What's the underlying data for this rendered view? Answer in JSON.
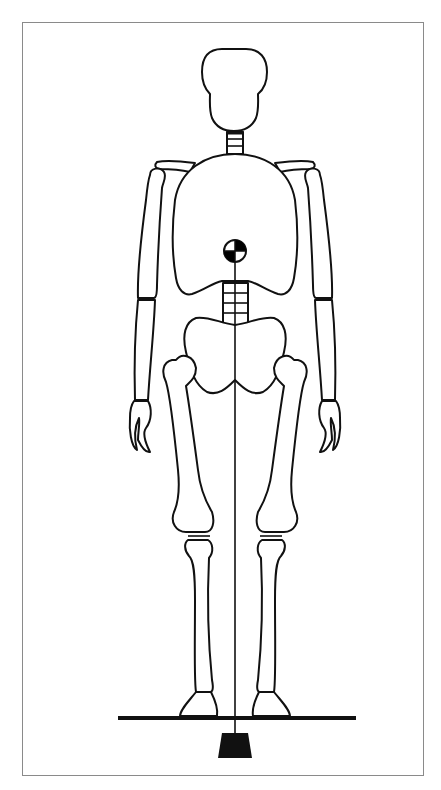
{
  "diagram": {
    "title": "",
    "elements": [
      {
        "id": "skull",
        "label": ""
      },
      {
        "id": "cervical-spine",
        "label": ""
      },
      {
        "id": "rib-cage",
        "label": ""
      },
      {
        "id": "lumbar-spine",
        "label": ""
      },
      {
        "id": "pelvis",
        "label": ""
      },
      {
        "id": "center-of-gravity-marker",
        "label": ""
      },
      {
        "id": "line-of-gravity",
        "label": ""
      },
      {
        "id": "ground-line",
        "label": ""
      },
      {
        "id": "plumb-weight",
        "label": ""
      }
    ],
    "colors": {
      "stroke": "#111111",
      "fill": "#ffffff",
      "frame": "#8a8a8a",
      "marker_fill": "#000000"
    }
  }
}
